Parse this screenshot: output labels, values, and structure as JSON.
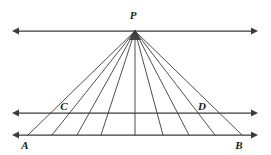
{
  "figure": {
    "type": "geometry-diagram",
    "width": 271,
    "height": 155,
    "background_color": "#ffffff",
    "stroke_color": "#3b3b3b",
    "label_color": "#1a1a1a"
  },
  "points": [
    {
      "id": "P",
      "label": "P",
      "x": 135,
      "y": 31,
      "label_x": 133,
      "label_y": 19,
      "role": "apex-vertex"
    },
    {
      "id": "C",
      "label": "C",
      "x": 73,
      "y": 113,
      "label_x": 64,
      "label_y": 110,
      "role": "point-on-middle-line"
    },
    {
      "id": "D",
      "label": "D",
      "x": 198,
      "y": 113,
      "label_x": 202,
      "label_y": 110,
      "role": "point-on-middle-line"
    },
    {
      "id": "A",
      "label": "A",
      "x": 28,
      "y": 135,
      "label_x": 25,
      "label_y": 149,
      "role": "point-on-bottom-line"
    },
    {
      "id": "B",
      "label": "B",
      "x": 242,
      "y": 135,
      "label_x": 239,
      "label_y": 149,
      "role": "point-on-bottom-line"
    }
  ],
  "lines": [
    {
      "id": "top-line",
      "name": "top-parallel-line",
      "y": 31,
      "x1": 12,
      "x2": 258,
      "arrow_start": true,
      "arrow_end": true,
      "passes_through": [
        "P"
      ]
    },
    {
      "id": "middle-line",
      "name": "middle-parallel-line",
      "y": 113,
      "x1": 12,
      "x2": 258,
      "arrow_start": true,
      "arrow_end": true,
      "passes_through": [
        "C",
        "D"
      ]
    },
    {
      "id": "bottom-line",
      "name": "bottom-parallel-line",
      "y": 135,
      "x1": 12,
      "x2": 258,
      "arrow_start": true,
      "arrow_end": true,
      "passes_through": [
        "A",
        "B"
      ]
    }
  ],
  "rays": [
    {
      "id": "ray-1",
      "from": "P",
      "to_x": 28,
      "to_y": 135,
      "mid_x": 73,
      "mid_y": 113
    },
    {
      "id": "ray-2",
      "from": "P",
      "to_x": 52,
      "to_y": 135,
      "mid_x": 89,
      "mid_y": 113
    },
    {
      "id": "ray-3",
      "from": "P",
      "to_x": 77,
      "to_y": 135,
      "mid_x": 105,
      "mid_y": 113
    },
    {
      "id": "ray-4",
      "from": "P",
      "to_x": 101,
      "to_y": 135,
      "mid_x": 120,
      "mid_y": 113
    },
    {
      "id": "ray-5",
      "from": "P",
      "to_x": 135,
      "to_y": 135,
      "mid_x": 135,
      "mid_y": 113
    },
    {
      "id": "ray-6",
      "from": "P",
      "to_x": 163,
      "to_y": 135,
      "mid_x": 153,
      "mid_y": 113
    },
    {
      "id": "ray-7",
      "from": "P",
      "to_x": 189,
      "to_y": 135,
      "mid_x": 169,
      "mid_y": 113
    },
    {
      "id": "ray-8",
      "from": "P",
      "to_x": 215,
      "to_y": 135,
      "mid_x": 184,
      "mid_y": 113
    },
    {
      "id": "ray-9",
      "from": "P",
      "to_x": 242,
      "to_y": 135,
      "mid_x": 198,
      "mid_y": 113
    }
  ],
  "ray_count": 9
}
